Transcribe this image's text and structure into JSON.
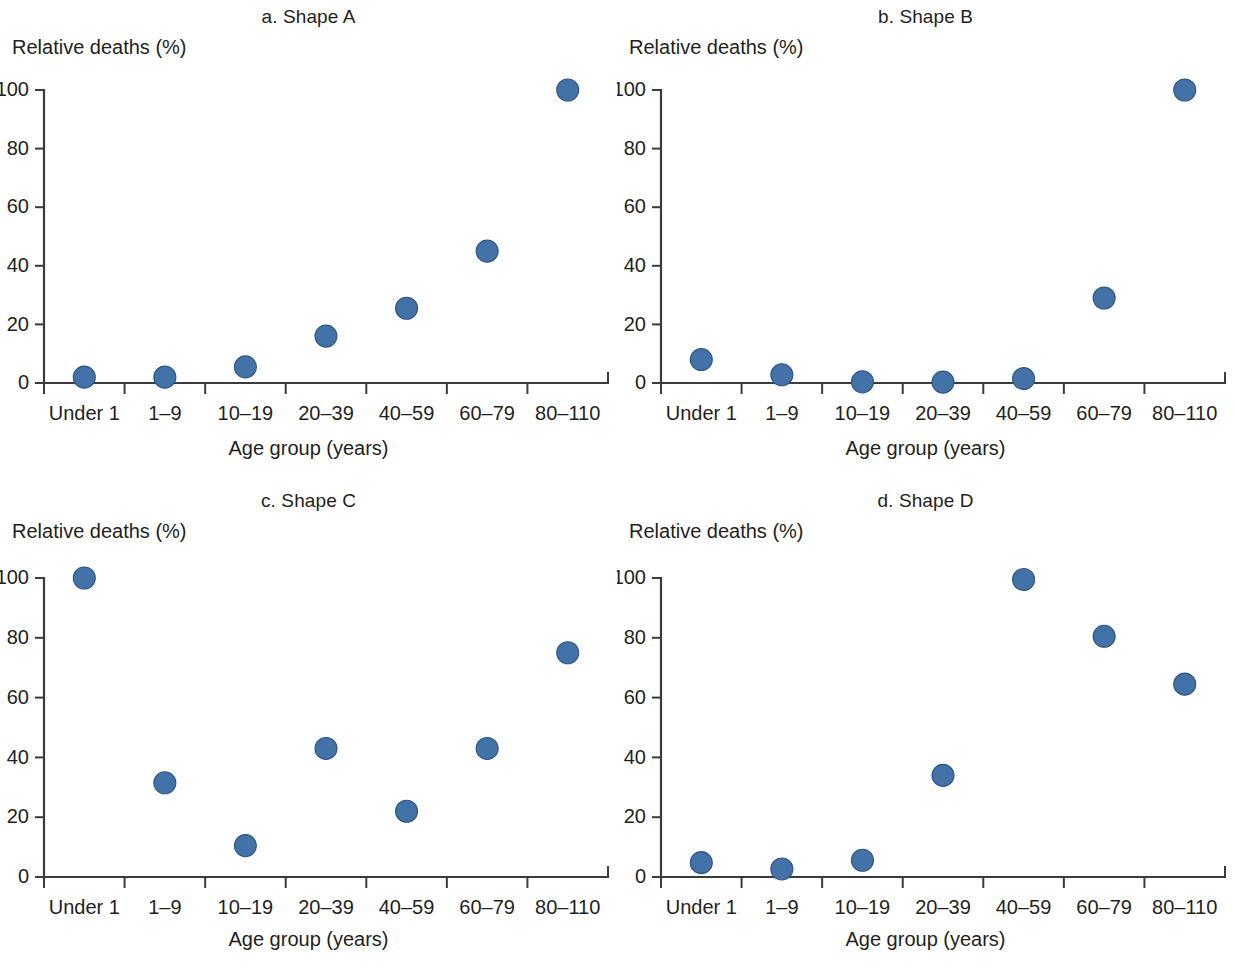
{
  "figure": {
    "background": "#ffffff",
    "marker_color": "#4272a8",
    "marker_edge_color": "#2e5782",
    "axis_color": "#3b3b3b",
    "text_color": "#231f20"
  },
  "common": {
    "ylabel": "Relative deaths (%)",
    "xlabel": "Age group (years)",
    "categories": [
      "Under 1",
      "1–9",
      "10–19",
      "20–39",
      "40–59",
      "60–79",
      "80–110"
    ],
    "yticks": [
      "0",
      "20",
      "40",
      "60",
      "80",
      "100"
    ]
  },
  "panels": [
    {
      "id": "a",
      "title": "a. Shape A"
    },
    {
      "id": "b",
      "title": "b. Shape B"
    },
    {
      "id": "c",
      "title": "c. Shape C"
    },
    {
      "id": "d",
      "title": "d. Shape D"
    }
  ],
  "chart_data": [
    {
      "type": "scatter",
      "title": "a. Shape A",
      "xlabel": "Age group (years)",
      "ylabel": "Relative deaths (%)",
      "categories": [
        "Under 1",
        "1–9",
        "10–19",
        "20–39",
        "40–59",
        "60–79",
        "80–110"
      ],
      "values": [
        2,
        2,
        5.5,
        16,
        25.5,
        45,
        100
      ],
      "ylim": [
        0,
        100
      ],
      "yticks": [
        0,
        20,
        40,
        60,
        80,
        100
      ],
      "grid": false,
      "legend": "none"
    },
    {
      "type": "scatter",
      "title": "b. Shape B",
      "xlabel": "Age group (years)",
      "ylabel": "Relative deaths (%)",
      "categories": [
        "Under 1",
        "1–9",
        "10–19",
        "20–39",
        "40–59",
        "60–79",
        "80–110"
      ],
      "values": [
        8,
        2.8,
        0.4,
        0.3,
        1.5,
        29,
        100
      ],
      "ylim": [
        0,
        100
      ],
      "yticks": [
        0,
        20,
        40,
        60,
        80,
        100
      ],
      "grid": false,
      "legend": "none"
    },
    {
      "type": "scatter",
      "title": "c. Shape C",
      "xlabel": "Age group (years)",
      "ylabel": "Relative deaths (%)",
      "categories": [
        "Under 1",
        "1–9",
        "10–19",
        "20–39",
        "40–59",
        "60–79",
        "80–110"
      ],
      "values": [
        100,
        31.5,
        10.5,
        43,
        22,
        43,
        75
      ],
      "ylim": [
        0,
        100
      ],
      "yticks": [
        0,
        20,
        40,
        60,
        80,
        100
      ],
      "grid": false,
      "legend": "none"
    },
    {
      "type": "scatter",
      "title": "d. Shape D",
      "xlabel": "Age group (years)",
      "ylabel": "Relative deaths (%)",
      "categories": [
        "Under 1",
        "1–9",
        "10–19",
        "20–39",
        "40–59",
        "60–79",
        "80–110"
      ],
      "values": [
        4.8,
        2.7,
        5.6,
        34,
        99.5,
        80.5,
        64.5
      ],
      "ylim": [
        0,
        100
      ],
      "yticks": [
        0,
        20,
        40,
        60,
        80,
        100
      ],
      "grid": false,
      "legend": "none"
    }
  ]
}
